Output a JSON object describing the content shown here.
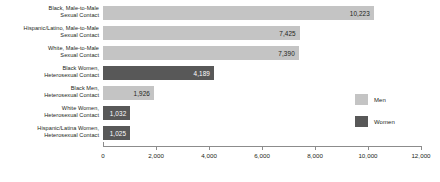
{
  "chart_data": {
    "type": "bar",
    "orientation": "horizontal",
    "title": "",
    "xlabel": "",
    "ylabel": "",
    "xlim": [
      0,
      12000
    ],
    "grid": false,
    "legend_position": "right",
    "tick_labels": [
      "0",
      "2,000",
      "4,000",
      "6,000",
      "8,000",
      "10,000",
      "12,000"
    ],
    "tick_values": [
      0,
      2000,
      4000,
      6000,
      8000,
      10000,
      12000
    ],
    "categories": [
      "Black, Male-to-Male Sexual Contact",
      "Hispanic/Latino, Male-to-Male Sexual Contact",
      "White, Male-to-Male Sexual Contact",
      "Black Women, Heterosexual Contact",
      "Black Men, Heterosexual Contact",
      "White Women, Heterosexual Contact",
      "Hispanic/Latina Women, Heterosexual Contact"
    ],
    "values": [
      10223,
      7425,
      7390,
      4189,
      1926,
      1032,
      1025
    ],
    "value_labels": [
      "10,223",
      "7,425",
      "7,390",
      "4,189",
      "1,926",
      "1,032",
      "1,025"
    ],
    "groups": [
      "Men",
      "Men",
      "Men",
      "Women",
      "Men",
      "Women",
      "Women"
    ],
    "series": [
      {
        "name": "Men",
        "color": "#c4c4c4"
      },
      {
        "name": "Women",
        "color": "#585858"
      }
    ]
  },
  "bars": [
    {
      "line1": "Black, Male-to-Male",
      "line2": "Sexual Contact",
      "label": "10,223",
      "value": 10223,
      "group": "men"
    },
    {
      "line1": "Hispanic/Latino, Male-to-Male",
      "line2": "Sexual Contact",
      "label": "7,425",
      "value": 7425,
      "group": "men"
    },
    {
      "line1": "White, Male-to-Male",
      "line2": "Sexual Contact",
      "label": "7,390",
      "value": 7390,
      "group": "men"
    },
    {
      "line1": "Black Women,",
      "line2": "Heterosexual Contact",
      "label": "4,189",
      "value": 4189,
      "group": "women"
    },
    {
      "line1": "Black Men,",
      "line2": "Heterosexual Contact",
      "label": "1,926",
      "value": 1926,
      "group": "men"
    },
    {
      "line1": "White Women,",
      "line2": "Heterosexual Contact",
      "label": "1,032",
      "value": 1032,
      "group": "women"
    },
    {
      "line1": "Hispanic/Latina Women,",
      "line2": "Heterosexual Contact",
      "label": "1,025",
      "value": 1025,
      "group": "women"
    }
  ],
  "legend": {
    "items": [
      {
        "label": "Men",
        "group": "men"
      },
      {
        "label": "Women",
        "group": "women"
      }
    ]
  },
  "colors": {
    "men": "#c4c4c4",
    "women": "#585858",
    "axis": "#8c8c8c",
    "text": "#231f20",
    "value_text_on_dark": "#ffffff"
  }
}
